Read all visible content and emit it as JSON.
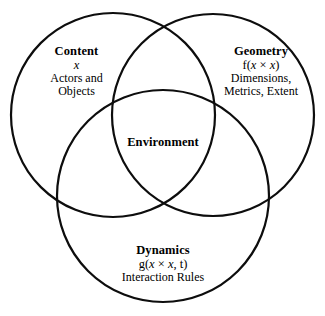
{
  "diagram": {
    "type": "venn-three-circle",
    "background_color": "#ffffff",
    "stroke_color": "#0d0d0d",
    "text_color": "#000000",
    "circles": [
      {
        "name": "content-circle",
        "cx": 113,
        "cy": 115,
        "r": 102
      },
      {
        "name": "geometry-circle",
        "cx": 213,
        "cy": 115,
        "r": 101
      },
      {
        "name": "dynamics-circle",
        "cx": 163,
        "cy": 196,
        "r": 106
      }
    ],
    "regions": {
      "content": {
        "title": "Content",
        "formula": "x",
        "description_line1": "Actors and",
        "description_line2": "Objects"
      },
      "geometry": {
        "title": "Geometry",
        "formula": "f(x × x)",
        "description_line1": "Dimensions,",
        "description_line2": "Metrics, Extent"
      },
      "dynamics": {
        "title": "Dynamics",
        "formula": "g(x × x, t)",
        "description_line1": "Interaction Rules"
      },
      "intersection": {
        "title": "Environment"
      }
    }
  }
}
